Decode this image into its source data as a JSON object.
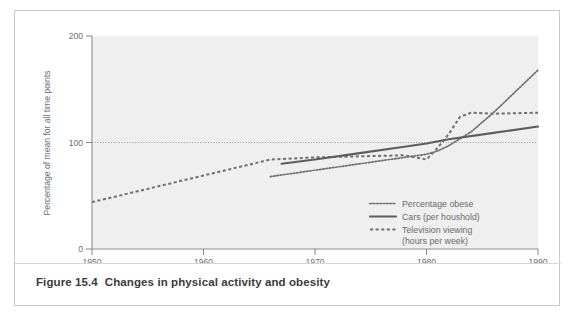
{
  "figure": {
    "caption_number": "Figure 15.4",
    "caption_text": "Changes in physical activity and obesity"
  },
  "chart_data": {
    "type": "line",
    "title": "",
    "xlabel": "Year of survey",
    "ylabel": "Percentage of mean for all time points",
    "xlim": [
      1950,
      1990
    ],
    "ylim": [
      0,
      200
    ],
    "xticks": [
      "1950",
      "1960",
      "1970",
      "1980",
      "1990"
    ],
    "yticks": [
      "0",
      "100",
      "200"
    ],
    "grid": false,
    "reference_line": 100,
    "legend_position": "inside-bottom-right",
    "series": [
      {
        "name": "Percentage obese",
        "style": "dotted",
        "x": [
          1966,
          1968,
          1970,
          1972,
          1974,
          1976,
          1978,
          1980,
          1981,
          1982,
          1984,
          1986,
          1988,
          1990
        ],
        "values": [
          68,
          71,
          74,
          77,
          80,
          83,
          86,
          89,
          92,
          97,
          110,
          128,
          148,
          168
        ]
      },
      {
        "name": "Cars (per houshold)",
        "style": "solid",
        "x": [
          1967,
          1970,
          1974,
          1978,
          1980,
          1982,
          1986,
          1990
        ],
        "values": [
          80,
          84,
          90,
          96,
          99,
          103,
          109,
          115
        ]
      },
      {
        "name": "Television viewing (hours per week)",
        "style": "dashed",
        "x": [
          1950,
          1954,
          1958,
          1962,
          1966,
          1970,
          1974,
          1978,
          1979,
          1980,
          1981,
          1982,
          1983,
          1984,
          1986,
          1990
        ],
        "values": [
          44,
          54,
          64,
          74,
          84,
          86,
          87,
          88,
          86,
          84,
          95,
          108,
          124,
          128,
          127,
          128
        ]
      }
    ],
    "legend": [
      {
        "label": "Percentage obese",
        "style": "dotted"
      },
      {
        "label": "Cars (per houshold)",
        "style": "solid"
      },
      {
        "label": "Television viewing",
        "style": "dashed"
      },
      {
        "label": "(hours per week)",
        "style": "none"
      }
    ]
  }
}
